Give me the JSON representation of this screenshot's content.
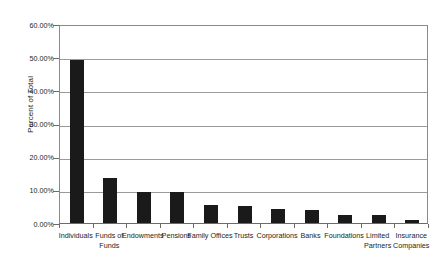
{
  "chart_data": {
    "type": "bar",
    "title": "",
    "subtitle": "",
    "xlabel": "",
    "ylabel": "Percent of Total",
    "ylim": [
      0,
      60
    ],
    "y_tick_labels": [
      "0.00%",
      "10.00%",
      "20.00%",
      "30.00%",
      "40.00%",
      "50.00%",
      "60.00%"
    ],
    "y_tick_values": [
      0,
      10,
      20,
      30,
      40,
      50,
      60
    ],
    "grid": true,
    "grid_axis": "y",
    "legend": false,
    "bar_color": "#1a1a1a",
    "axis_color": "#8a8a8a",
    "background": "#ffffff",
    "value_unit": "percent",
    "categories": [
      "Individuals",
      "Funds of Funds",
      "Endowments",
      "Pensions",
      "Family Offices",
      "Trusts",
      "Corporations",
      "Banks",
      "Foundations",
      "Limited Partners",
      "Insurance Companies"
    ],
    "values": [
      49.0,
      13.7,
      9.4,
      9.4,
      5.5,
      5.1,
      4.3,
      3.8,
      2.5,
      2.4,
      1.0
    ]
  }
}
